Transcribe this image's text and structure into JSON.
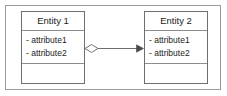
{
  "diagram": {
    "type": "uml-class-diagram",
    "background_color": "#ffffff",
    "frame": {
      "name": "diagram-frame",
      "border_color": "#9a9a9a"
    },
    "classes": [
      {
        "id": "entity-1",
        "name": "Entity 1",
        "attributes": [
          "- attribute1",
          "- attribute2"
        ],
        "operations": [],
        "border_color": "#6f6f6f",
        "fill_color": "#ffffff"
      },
      {
        "id": "entity-2",
        "name": "Entity 2",
        "attributes": [
          "- attribute1",
          "- attribute2"
        ],
        "operations": [],
        "border_color": "#6f6f6f",
        "fill_color": "#ffffff"
      }
    ],
    "relationship": {
      "kind": "aggregation",
      "source": "Entity 1",
      "target": "Entity 2",
      "source_decoration": "hollow-diamond",
      "target_decoration": "filled-arrowhead",
      "line_color": "#6f6f6f",
      "label": ""
    }
  }
}
